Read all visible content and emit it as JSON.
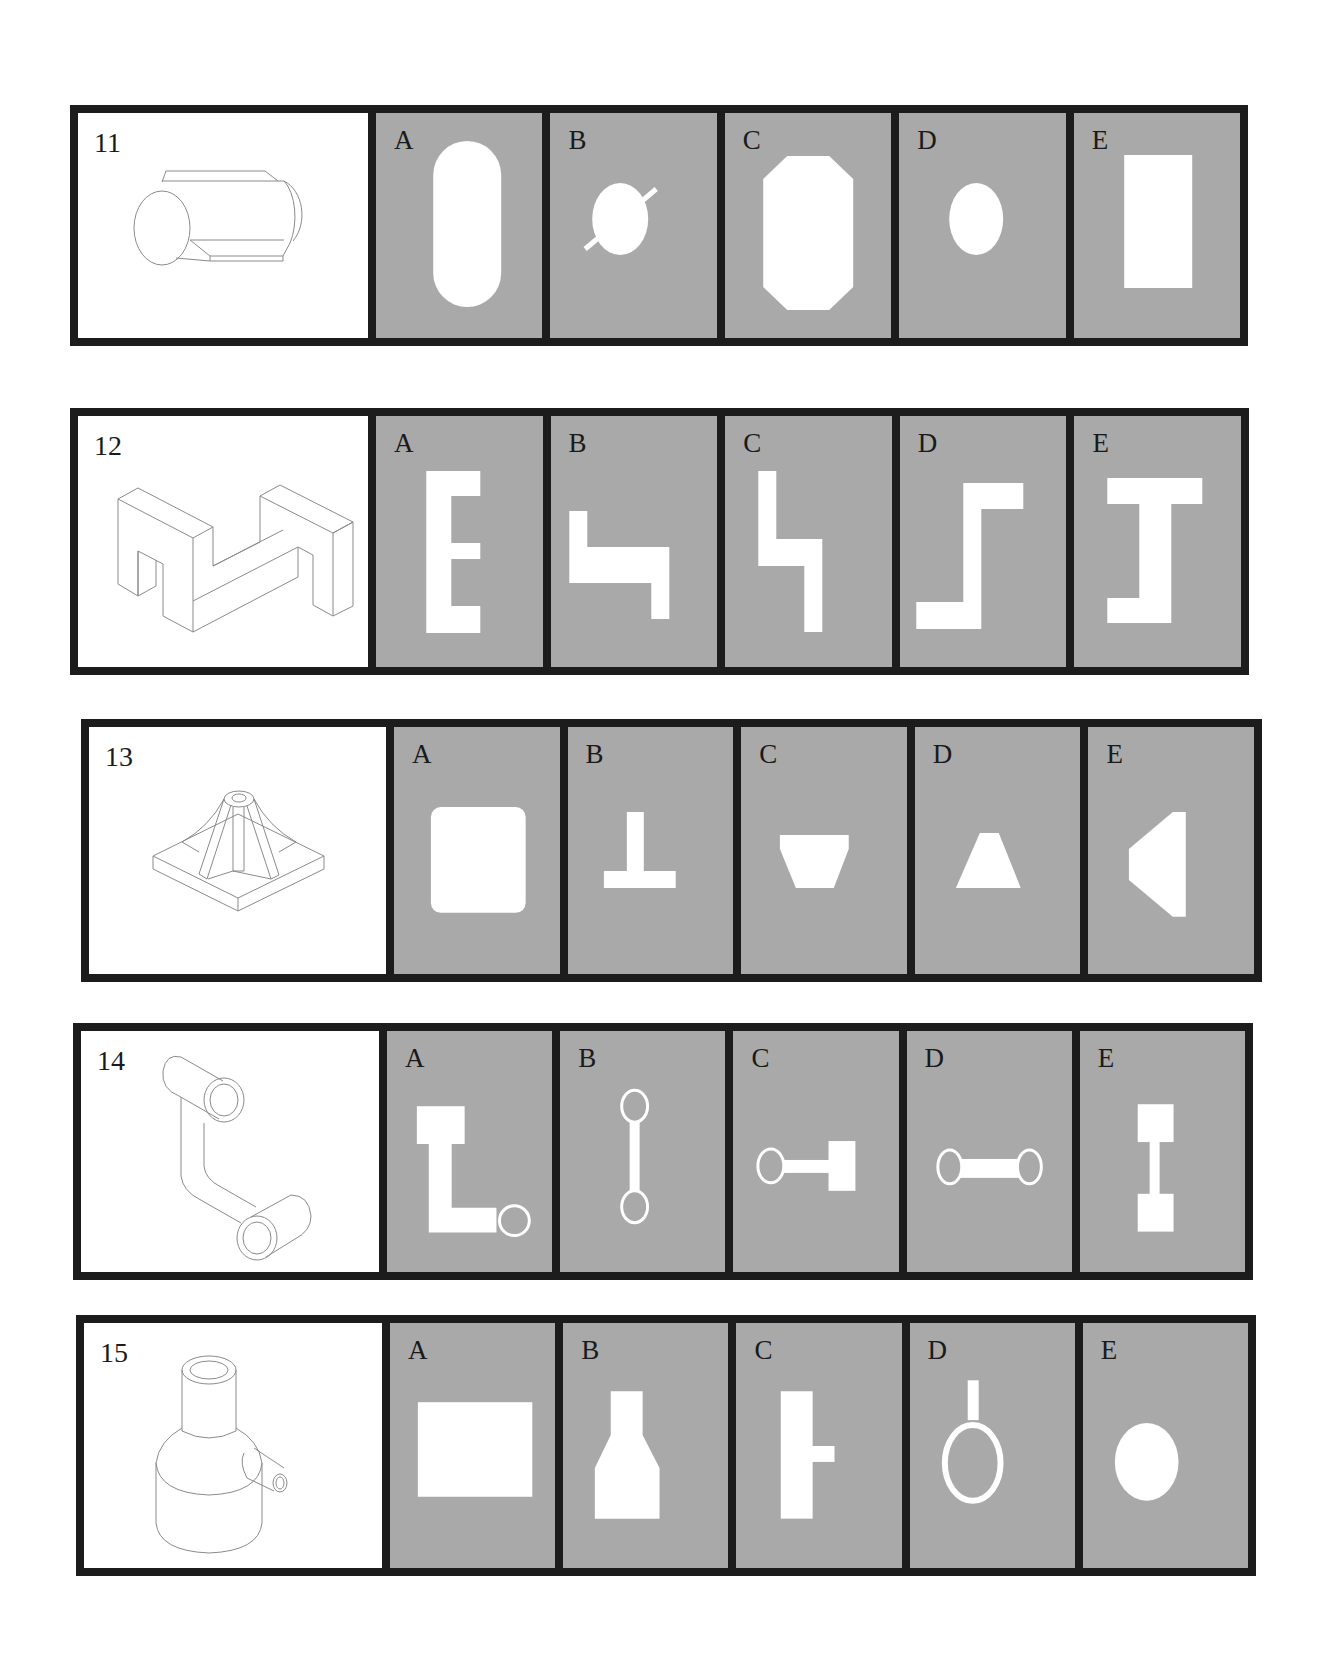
{
  "questions": [
    {
      "number": "11",
      "drawing": "horizontal-cylinder-with-wedge-cut-and-flat",
      "options": [
        {
          "letter": "A",
          "shape": "vertical-stadium"
        },
        {
          "letter": "B",
          "shape": "circle-with-diagonal-line"
        },
        {
          "letter": "C",
          "shape": "octagon-tall"
        },
        {
          "letter": "D",
          "shape": "circle"
        },
        {
          "letter": "E",
          "shape": "tall-rectangle"
        }
      ]
    },
    {
      "number": "12",
      "drawing": "isometric-z-block-with-notched-ends",
      "options": [
        {
          "letter": "A",
          "shape": "E-letter"
        },
        {
          "letter": "B",
          "shape": "stepped-L-horizontal"
        },
        {
          "letter": "C",
          "shape": "stepped-L-vertical"
        },
        {
          "letter": "D",
          "shape": "Z-step"
        },
        {
          "letter": "E",
          "shape": "I-beam-bracket"
        }
      ]
    },
    {
      "number": "13",
      "drawing": "square-base-with-ribbed-pyramid-and-tube",
      "options": [
        {
          "letter": "A",
          "shape": "rounded-square"
        },
        {
          "letter": "B",
          "shape": "inverted-T"
        },
        {
          "letter": "C",
          "shape": "inverted-trapezoid"
        },
        {
          "letter": "D",
          "shape": "trapezoid"
        },
        {
          "letter": "E",
          "shape": "left-pointing-trapezoid"
        }
      ]
    },
    {
      "number": "14",
      "drawing": "two-tubes-joined-by-bent-arm",
      "options": [
        {
          "letter": "A",
          "shape": "L-with-ring"
        },
        {
          "letter": "B",
          "shape": "vertical-dumbbell-rings"
        },
        {
          "letter": "C",
          "shape": "ring-bar-square"
        },
        {
          "letter": "D",
          "shape": "horizontal-dumbbell-rings"
        },
        {
          "letter": "E",
          "shape": "vertical-dumbbell-squares"
        }
      ]
    },
    {
      "number": "15",
      "drawing": "stepped-cylinder-with-side-pipe",
      "options": [
        {
          "letter": "A",
          "shape": "wide-rectangle"
        },
        {
          "letter": "B",
          "shape": "bottle-profile"
        },
        {
          "letter": "C",
          "shape": "rectangle-with-side-tab"
        },
        {
          "letter": "D",
          "shape": "ring-with-stem"
        },
        {
          "letter": "E",
          "shape": "oval"
        }
      ]
    }
  ],
  "colors": {
    "border": "#1c1c1c",
    "option_background": "#a9a9a9",
    "question_background": "#ffffff",
    "shape_fill": "#ffffff"
  }
}
